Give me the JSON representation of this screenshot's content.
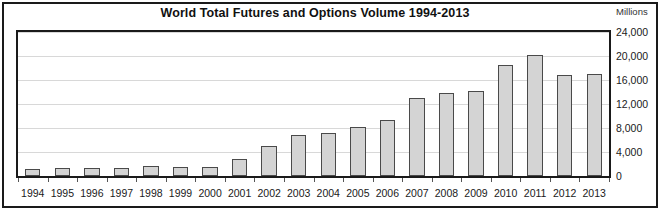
{
  "chart_data": {
    "type": "bar",
    "title": "World Total Futures and Options Volume 1994-2013",
    "xlabel": "",
    "ylabel": "Millions",
    "unit_label": "Millions",
    "categories": [
      "1994",
      "1995",
      "1996",
      "1997",
      "1998",
      "1999",
      "2000",
      "2001",
      "2002",
      "2003",
      "2004",
      "2005",
      "2006",
      "2007",
      "2008",
      "2009",
      "2010",
      "2011",
      "2012",
      "2013"
    ],
    "values": [
      1200,
      1400,
      1400,
      1400,
      1600,
      1500,
      1500,
      2800,
      5000,
      6800,
      7200,
      8200,
      9300,
      13000,
      13800,
      14100,
      18500,
      20200,
      16800,
      17000
    ],
    "ylim": [
      0,
      24000
    ],
    "ytick_values": [
      0,
      4000,
      8000,
      12000,
      16000,
      20000,
      24000
    ],
    "ytick_labels": [
      "0",
      "4,000",
      "8,000",
      "12,000",
      "16,000",
      "20,000",
      "24,000"
    ],
    "grid": true,
    "legend": null,
    "bar_color": "#d4d4d4",
    "bar_edge_color": "#4a4a4a",
    "gridline_color": "#d8d8d8",
    "frame_color": "#1a1a1a"
  }
}
